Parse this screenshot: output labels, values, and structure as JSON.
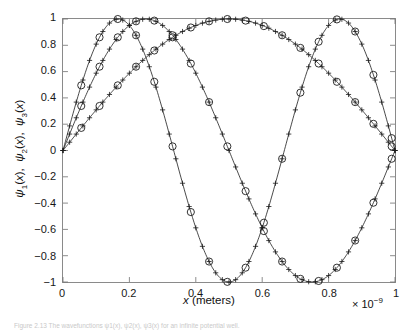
{
  "figure": {
    "caption": "Figure 2.13 The wavefunctions ψ1(x), ψ2(x), ψ3(x) for an infinite potential well."
  },
  "axes": {
    "x_label_symbol": "x",
    "x_label_unit": "(meters)",
    "x_exponent_prefix": "× 10",
    "x_exponent": "−9",
    "y_label_parts": [
      "ψ",
      "1",
      "(x),  ",
      "ψ",
      "2",
      "(x),  ",
      "ψ",
      "3",
      "(x)"
    ],
    "xticks": [
      "0",
      "0.2",
      "0.4",
      "0.6",
      "0.8",
      "1"
    ],
    "xtick_values": [
      0,
      0.2,
      0.4,
      0.6,
      0.8,
      1
    ],
    "yticks": [
      "1",
      "0.8",
      "0.6",
      "0.4",
      "0.2",
      "0",
      "−0.2",
      "−0.4",
      "−0.6",
      "−0.8",
      "−1"
    ],
    "ytick_values": [
      1,
      0.8,
      0.6,
      0.4,
      0.2,
      0,
      -0.2,
      -0.4,
      -0.6,
      -0.8,
      -1
    ],
    "xlim": [
      0,
      1
    ],
    "ylim": [
      -1,
      1
    ],
    "grid": false,
    "frame_color": "#8a8a8a",
    "line_color": "#1a1a1a"
  },
  "chart_data": {
    "type": "line",
    "title": "",
    "xlabel": "x (meters)",
    "ylabel": "ψ1(x), ψ2(x), ψ3(x)",
    "xlim": [
      0,
      1
    ],
    "ylim": [
      -1,
      1
    ],
    "x_scale_factor": "1e-9",
    "grid": false,
    "legend": "none",
    "marker_line": "plus",
    "marker_overlay": "circle",
    "x": [
      0,
      0.02,
      0.04,
      0.06,
      0.08,
      0.1,
      0.12,
      0.14,
      0.16,
      0.18,
      0.2,
      0.22,
      0.24,
      0.26,
      0.28,
      0.3,
      0.32,
      0.34,
      0.36,
      0.38,
      0.4,
      0.42,
      0.44,
      0.46,
      0.48,
      0.5,
      0.52,
      0.54,
      0.56,
      0.58,
      0.6,
      0.62,
      0.64,
      0.66,
      0.68,
      0.7,
      0.72,
      0.74,
      0.76,
      0.78,
      0.8,
      0.82,
      0.84,
      0.86,
      0.88,
      0.9,
      0.92,
      0.94,
      0.96,
      0.98,
      1
    ],
    "x_circles": [
      0.055,
      0.11,
      0.165,
      0.22,
      0.275,
      0.33,
      0.385,
      0.44,
      0.495,
      0.55,
      0.605,
      0.66,
      0.715,
      0.77,
      0.825,
      0.88,
      0.935,
      0.99
    ],
    "series": [
      {
        "name": "ψ1(x)",
        "formula": "sin(pi*x)",
        "n": 1,
        "values": [
          0,
          0.063,
          0.125,
          0.187,
          0.249,
          0.309,
          0.368,
          0.426,
          0.482,
          0.536,
          0.588,
          0.637,
          0.685,
          0.729,
          0.771,
          0.809,
          0.844,
          0.876,
          0.905,
          0.93,
          0.951,
          0.969,
          0.982,
          0.992,
          0.998,
          1.0,
          0.998,
          0.992,
          0.982,
          0.969,
          0.951,
          0.93,
          0.905,
          0.876,
          0.844,
          0.809,
          0.771,
          0.729,
          0.685,
          0.637,
          0.588,
          0.536,
          0.482,
          0.426,
          0.368,
          0.309,
          0.249,
          0.187,
          0.125,
          0.063,
          0
        ]
      },
      {
        "name": "ψ2(x)",
        "formula": "sin(2*pi*x)",
        "n": 2,
        "values": [
          0,
          0.125,
          0.249,
          0.368,
          0.482,
          0.588,
          0.685,
          0.771,
          0.844,
          0.905,
          0.951,
          0.982,
          0.998,
          0.998,
          0.982,
          0.951,
          0.905,
          0.844,
          0.771,
          0.685,
          0.588,
          0.482,
          0.368,
          0.249,
          0.125,
          0,
          -0.125,
          -0.249,
          -0.368,
          -0.482,
          -0.588,
          -0.685,
          -0.771,
          -0.844,
          -0.905,
          -0.951,
          -0.982,
          -0.998,
          -0.998,
          -0.982,
          -0.951,
          -0.905,
          -0.844,
          -0.771,
          -0.685,
          -0.588,
          -0.482,
          -0.368,
          -0.249,
          -0.125,
          0
        ]
      },
      {
        "name": "ψ3(x)",
        "formula": "sin(3*pi*x)",
        "n": 3,
        "values": [
          0,
          0.187,
          0.368,
          0.536,
          0.685,
          0.809,
          0.905,
          0.969,
          0.998,
          0.992,
          0.951,
          0.876,
          0.771,
          0.637,
          0.482,
          0.309,
          0.125,
          -0.063,
          -0.249,
          -0.426,
          -0.588,
          -0.729,
          -0.844,
          -0.93,
          -0.982,
          -1.0,
          -0.982,
          -0.93,
          -0.844,
          -0.729,
          -0.588,
          -0.426,
          -0.249,
          -0.063,
          0.125,
          0.309,
          0.482,
          0.637,
          0.771,
          0.876,
          0.951,
          0.992,
          0.998,
          0.969,
          0.905,
          0.809,
          0.685,
          0.536,
          0.368,
          0.187,
          0
        ]
      }
    ]
  }
}
